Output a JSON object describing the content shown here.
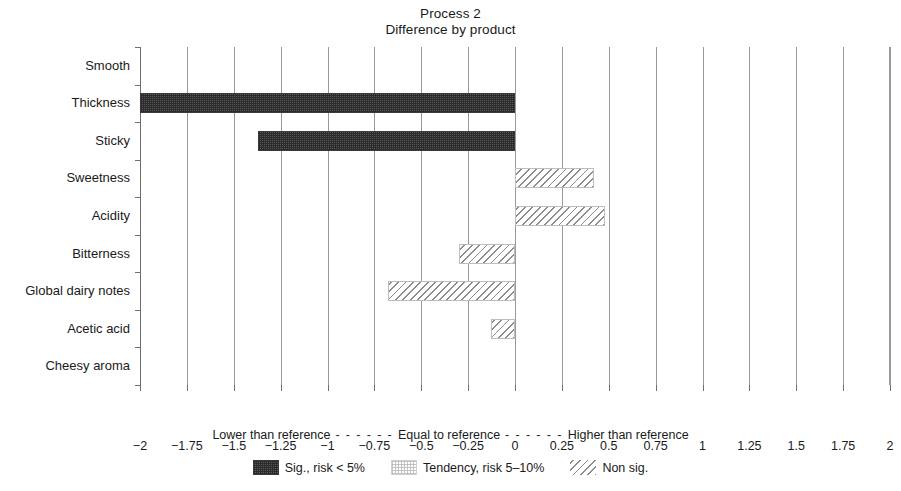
{
  "title": {
    "main": "Process 2",
    "sub": "Difference by product"
  },
  "chart_data": {
    "type": "bar",
    "orientation": "horizontal",
    "title": "Process 2",
    "subtitle": "Difference by product",
    "xlabel": "",
    "ylabel": "",
    "xlim": [
      -2,
      2
    ],
    "grid": true,
    "legend_position": "bottom",
    "categories": [
      "Smooth",
      "Thickness",
      "Sticky",
      "Sweetness",
      "Acidity",
      "Bitterness",
      "Global dairy notes",
      "Acetic acid",
      "Cheesy aroma"
    ],
    "values": [
      0,
      -2,
      -1.37,
      0.42,
      0.48,
      -0.3,
      -0.68,
      -0.13,
      0
    ],
    "significance": [
      "none",
      "sig",
      "sig",
      "nonsig",
      "nonsig",
      "nonsig",
      "nonsig",
      "nonsig",
      "none"
    ],
    "xticks": [
      -2,
      -1.75,
      -1.5,
      -1.25,
      -1,
      -0.75,
      -0.5,
      -0.25,
      0,
      0.25,
      0.5,
      0.75,
      1,
      1.25,
      1.5,
      1.75,
      2
    ],
    "xticklabels": [
      "−2",
      "−1.75",
      "−1.5",
      "−1.25",
      "−1",
      "−0.75",
      "−0.5",
      "−0.25",
      "0",
      "0.25",
      "0.5",
      "0.75",
      "1",
      "1.25",
      "1.5",
      "1.75",
      "2"
    ],
    "annotations": {
      "lower": "Lower than reference",
      "equal": "Equal to reference",
      "higher": "Higher than reference",
      "separator": "- - - - - -"
    },
    "legend": [
      {
        "label": "Sig., risk < 5%",
        "pattern": "checker-dark"
      },
      {
        "label": "Tendency, risk 5–10%",
        "pattern": "dotted-light"
      },
      {
        "label": "Non sig.",
        "pattern": "diagonal-hatch"
      }
    ],
    "colors": {
      "sig_fill": "#3a3a3a",
      "tendency_fill": "#c2c2c2",
      "nonsig_fill": "#8c8c8c",
      "gridline": "#9a9a9a",
      "axis": "#6e6e6e",
      "text": "#1a1a1a",
      "background": "#ffffff"
    }
  },
  "reference_caption": {
    "lower": "Lower than reference",
    "dash1": " - - - - - - ",
    "equal": "Equal to reference",
    "dash2": " - - - - - - ",
    "higher": "Higher than reference"
  }
}
